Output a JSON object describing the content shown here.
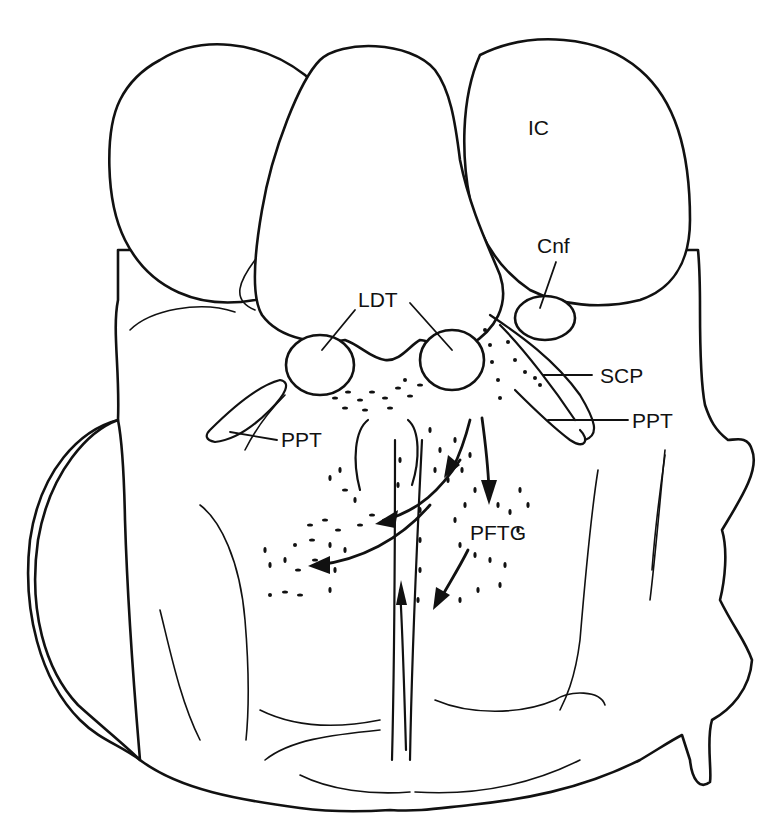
{
  "diagram": {
    "type": "anatomical-line-drawing",
    "line_color": "#111111",
    "background": "#ffffff",
    "labels": {
      "ic": "IC",
      "cnf": "Cnf",
      "ldt": "LDT",
      "scp": "SCP",
      "ppt_right": "PPT",
      "ppt_left": "PPT",
      "pftg": "PFTG"
    }
  }
}
